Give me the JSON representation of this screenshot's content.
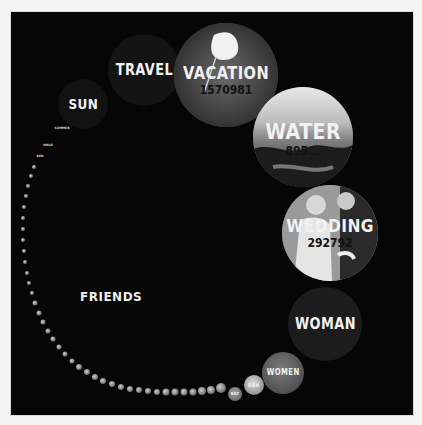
{
  "visualization": {
    "type": "tag-popularity-bubbles",
    "colors": {
      "page_background": "#f4f4f4",
      "panel_background": "#060606",
      "label_color": "#f2f2f2",
      "count_color": "#111111",
      "plain_bubble": "#1a1a1a"
    },
    "bubbles": [
      {
        "tag": "VACATION",
        "count": "1570981",
        "style": "photo-flower"
      },
      {
        "tag": "WATER",
        "count": "895...",
        "style": "photo-sea"
      },
      {
        "tag": "WEDDING",
        "count": "292792",
        "style": "photo-wedding"
      },
      {
        "tag": "WOMAN",
        "count": "",
        "style": "plain"
      },
      {
        "tag": "WOMEN",
        "count": "",
        "style": "photo-small"
      },
      {
        "tag": "BAN",
        "count": "",
        "style": "photo-small"
      },
      {
        "tag": "BAY",
        "count": "",
        "style": "photo-small"
      },
      {
        "tag": "TRAVEL",
        "count": "",
        "style": "plain"
      },
      {
        "tag": "SUN",
        "count": "",
        "style": "plain"
      },
      {
        "tag": "SUMMER",
        "count": "",
        "style": "tiny"
      },
      {
        "tag": "SMILE",
        "count": "",
        "style": "tiny"
      },
      {
        "tag": "RED",
        "count": "",
        "style": "tiny"
      },
      {
        "tag": "FRIENDS",
        "count": "",
        "style": "center-label"
      }
    ]
  }
}
